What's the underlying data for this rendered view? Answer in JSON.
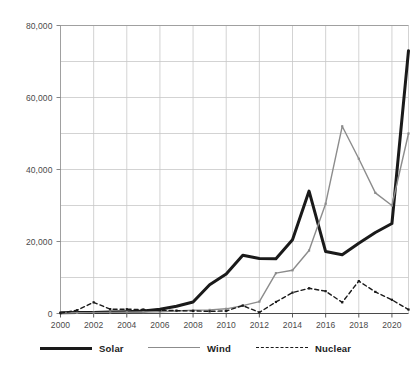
{
  "chart_data": {
    "type": "line",
    "title": "",
    "xlabel": "",
    "ylabel": "",
    "xlim": [
      2000,
      2021
    ],
    "ylim": [
      0,
      80000
    ],
    "grid": true,
    "legend_position": "bottom",
    "x": [
      2000,
      2001,
      2002,
      2003,
      2004,
      2005,
      2006,
      2007,
      2008,
      2009,
      2010,
      2011,
      2012,
      2013,
      2014,
      2015,
      2016,
      2017,
      2018,
      2019,
      2020,
      2021
    ],
    "xticks": [
      "2000",
      "2002",
      "2004",
      "2006",
      "2008",
      "2010",
      "2012",
      "2014",
      "2016",
      "2018",
      "2020"
    ],
    "xtick_values": [
      2000,
      2002,
      2004,
      2006,
      2008,
      2010,
      2012,
      2014,
      2016,
      2018,
      2020
    ],
    "yticks": [
      "0",
      "20,000",
      "40,000",
      "60,000",
      "80,000"
    ],
    "ytick_values": [
      0,
      20000,
      40000,
      60000,
      80000
    ],
    "minor_ytick_values": [
      10000,
      30000,
      50000,
      70000
    ],
    "series": [
      {
        "name": "Solar",
        "color": "#1a1a1a",
        "style": "solid",
        "width": 3,
        "values": [
          200,
          300,
          300,
          400,
          500,
          700,
          1200,
          2000,
          3200,
          8000,
          11000,
          16200,
          15300,
          15200,
          20500,
          34000,
          17200,
          16300,
          19500,
          22500,
          25000,
          73000
        ]
      },
      {
        "name": "Wind",
        "color": "#8c8c8c",
        "style": "solid",
        "width": 1.4,
        "values": [
          150,
          200,
          250,
          300,
          350,
          400,
          500,
          700,
          900,
          1000,
          1300,
          2200,
          3300,
          11200,
          12000,
          17500,
          30500,
          52000,
          43000,
          33500,
          30000,
          50000
        ]
      },
      {
        "name": "Nuclear",
        "color": "#1a1a1a",
        "style": "dashed",
        "width": 1.4,
        "values": [
          100,
          900,
          3100,
          1200,
          1200,
          1100,
          900,
          800,
          700,
          600,
          700,
          2200,
          300,
          3200,
          5800,
          7000,
          6200,
          3100,
          9000,
          6000,
          3800,
          1100
        ]
      }
    ]
  }
}
